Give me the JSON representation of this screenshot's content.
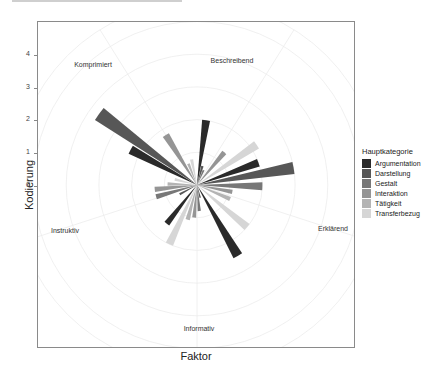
{
  "axes": {
    "ylabel": "Kodierung",
    "xlabel": "Faktor",
    "yticks": [
      "4",
      "3",
      "2",
      "1",
      "0"
    ]
  },
  "legend": {
    "title": "Hauptkategorie",
    "items": [
      {
        "label": "Argumentation",
        "color": "#2a2a2a"
      },
      {
        "label": "Darstellung",
        "color": "#575757"
      },
      {
        "label": "Gestalt",
        "color": "#777777"
      },
      {
        "label": "Interaktion",
        "color": "#959595"
      },
      {
        "label": "Tätigkeit",
        "color": "#b4b4b4"
      },
      {
        "label": "Transferbezug",
        "color": "#d6d6d6"
      }
    ]
  },
  "categories": [
    "Beschreibend",
    "Erklärend",
    "Informativ",
    "Instruktiv",
    "Komprimiert"
  ],
  "chart_data": {
    "type": "bar",
    "subtype": "polar (rose) bar chart",
    "title": "",
    "xlabel": "Faktor",
    "ylabel": "Kodierung",
    "ylim": [
      -1,
      4.5
    ],
    "yticks": [
      0,
      1,
      2,
      3,
      4
    ],
    "grid": true,
    "legend_position": "right",
    "legend_title": "Hauptkategorie",
    "categories": [
      "Beschreibend",
      "Erklärend",
      "Informativ",
      "Instruktiv",
      "Komprimiert"
    ],
    "category_angles_deg": [
      32,
      108,
      180,
      252,
      328
    ],
    "bars": [
      {
        "angle": 8,
        "width": 7,
        "series": "Argumentation",
        "value": 1.0
      },
      {
        "angle": 16,
        "width": 7,
        "series": "Darstellung",
        "value": -0.4
      },
      {
        "angle": 24,
        "width": 7,
        "series": "Gestalt",
        "value": -0.5
      },
      {
        "angle": 40,
        "width": 7,
        "series": "Interaktion",
        "value": 0.3
      },
      {
        "angle": 56,
        "width": 7,
        "series": "Transferbezug",
        "value": 1.2
      },
      {
        "angle": 70,
        "width": 7,
        "series": "Argumentation",
        "value": 1.0
      },
      {
        "angle": 80,
        "width": 7,
        "series": "Darstellung",
        "value": 2.0
      },
      {
        "angle": 91,
        "width": 7,
        "series": "Gestalt",
        "value": 1.0
      },
      {
        "angle": 101,
        "width": 7,
        "series": "Interaktion",
        "value": 0.1
      },
      {
        "angle": 113,
        "width": 7,
        "series": "Tätigkeit",
        "value": 0.1
      },
      {
        "angle": 130,
        "width": 7,
        "series": "Transferbezug",
        "value": 1.0
      },
      {
        "angle": 150,
        "width": 7,
        "series": "Argumentation",
        "value": 1.5
      },
      {
        "angle": 166,
        "width": 7,
        "series": "Darstellung",
        "value": -0.6
      },
      {
        "angle": 175,
        "width": 7,
        "series": "Gestalt",
        "value": -0.2
      },
      {
        "angle": 185,
        "width": 7,
        "series": "Interaktion",
        "value": 0.0
      },
      {
        "angle": 195,
        "width": 7,
        "series": "Tätigkeit",
        "value": 0.1
      },
      {
        "angle": 205,
        "width": 7,
        "series": "Transferbezug",
        "value": 1.0
      },
      {
        "angle": 218,
        "width": 7,
        "series": "Argumentation",
        "value": 0.5
      },
      {
        "angle": 242,
        "width": 7,
        "series": "Darstellung",
        "value": -0.4
      },
      {
        "angle": 254,
        "width": 7,
        "series": "Gestalt",
        "value": 0.3
      },
      {
        "angle": 264,
        "width": 7,
        "series": "Interaktion",
        "value": 0.3
      },
      {
        "angle": 272,
        "width": 7,
        "series": "Tätigkeit",
        "value": -0.1
      },
      {
        "angle": 284,
        "width": 7,
        "series": "Transferbezug",
        "value": -0.3
      },
      {
        "angle": 298,
        "width": 7,
        "series": "Argumentation",
        "value": 1.3
      },
      {
        "angle": 306,
        "width": 7,
        "series": "Darstellung",
        "value": 2.7
      },
      {
        "angle": 328,
        "width": 7,
        "series": "Interaktion",
        "value": 0.8
      },
      {
        "angle": 338,
        "width": 7,
        "series": "Tätigkeit",
        "value": -0.3
      },
      {
        "angle": 348,
        "width": 7,
        "series": "Transferbezug",
        "value": -0.2
      }
    ],
    "series": [
      {
        "name": "Argumentation",
        "color": "#2a2a2a"
      },
      {
        "name": "Darstellung",
        "color": "#575757"
      },
      {
        "name": "Gestalt",
        "color": "#777777"
      },
      {
        "name": "Interaktion",
        "color": "#959595"
      },
      {
        "name": "Tätigkeit",
        "color": "#b4b4b4"
      },
      {
        "name": "Transferbezug",
        "color": "#d6d6d6"
      }
    ]
  }
}
